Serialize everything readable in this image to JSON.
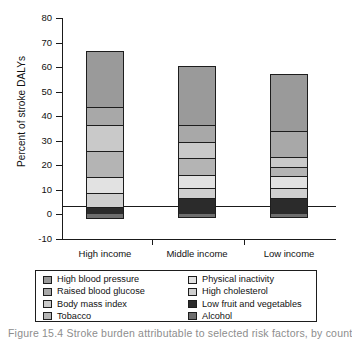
{
  "chart_data": {
    "type": "bar",
    "subtype": "stacked-bar",
    "title": "",
    "xlabel": "",
    "ylabel": "Percent of stroke DALYs",
    "categories": [
      "High income",
      "Middle income",
      "Low income"
    ],
    "ylim": [
      -10,
      80
    ],
    "yticks": [
      80,
      70,
      60,
      50,
      40,
      30,
      20,
      10,
      0,
      -10
    ],
    "ytick_labels": [
      "80",
      "70",
      "60",
      "50",
      "40",
      "30",
      "20",
      "10",
      "0",
      "-10"
    ],
    "grid": false,
    "legend_position": "below-plot",
    "series": [
      {
        "name": "High blood pressure",
        "color": "#9a9a9a",
        "values": [
          22.6,
          23.9,
          23.0
        ]
      },
      {
        "name": "Raised blood glucose",
        "color": "#a8a8a8",
        "values": [
          7.4,
          6.9,
          10.6
        ]
      },
      {
        "name": "Body mass index",
        "color": "#c9c9c9",
        "values": [
          10.5,
          6.7,
          3.9
        ]
      },
      {
        "name": "Tobacco",
        "color": "#b4b4b4",
        "values": [
          10.9,
          6.8,
          4.0
        ]
      },
      {
        "name": "Physical inactivity",
        "color": "#e2e2e2",
        "values": [
          6.2,
          5.4,
          4.6
        ]
      },
      {
        "name": "High cholesterol",
        "color": "#cfcfcf",
        "values": [
          6.0,
          4.1,
          4.2
        ]
      },
      {
        "name": "Low fruit and vegetables",
        "color": "#2b2b2b",
        "values": [
          2.9,
          6.7,
          6.7
        ]
      },
      {
        "name": "Alcohol",
        "color": "#6e6e6e",
        "values": [
          -1.8,
          -1.5,
          -1.4
        ]
      }
    ],
    "totals_positive": [
      66.5,
      60.5,
      57.0
    ],
    "axis_line_color": "#1a1a1a"
  },
  "axis": {
    "y_title": "Percent of stroke DALYs",
    "ticks": [
      "80",
      "70",
      "60",
      "50",
      "40",
      "30",
      "20",
      "10",
      "0",
      "-10"
    ],
    "x_categories": [
      "High income",
      "Middle income",
      "Low income"
    ]
  },
  "legend": {
    "left_column": [
      {
        "label": "High blood pressure",
        "swatch": "#9a9a9a"
      },
      {
        "label": "Raised blood glucose",
        "swatch": "#a8a8a8"
      },
      {
        "label": "Body mass index",
        "swatch": "#c9c9c9"
      },
      {
        "label": "Tobacco",
        "swatch": "#b4b4b4"
      }
    ],
    "right_column": [
      {
        "label": "Physical inactivity",
        "swatch": "#e2e2e2"
      },
      {
        "label": "High cholesterol",
        "swatch": "#cfcfcf"
      },
      {
        "label": "Low fruit and vegetables",
        "swatch": "#2b2b2b"
      },
      {
        "label": "Alcohol",
        "swatch": "#6e6e6e"
      }
    ]
  },
  "caption": {
    "text": "Figure 15.4   Stroke burden attributable to selected risk factors, by country income group"
  }
}
